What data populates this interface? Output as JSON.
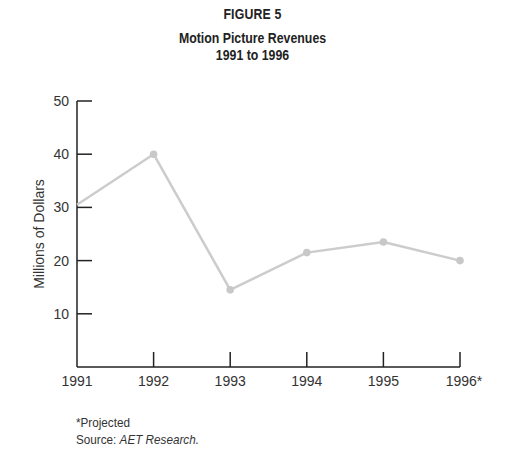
{
  "figure_label": "FIGURE 5",
  "title_line1": "Motion Picture Revenues",
  "title_line2": "1991 to 1996",
  "footer": {
    "note": "*Projected",
    "source_prefix": "Source: ",
    "source_name": "AET Research."
  },
  "colors": {
    "axis": "#222222",
    "line": "#cccccc",
    "marker": "#c8c8c8"
  },
  "chart_data": {
    "type": "line",
    "title": "Motion Picture Revenues 1991 to 1996",
    "xlabel": "",
    "ylabel": "Millions of Dollars",
    "categories": [
      "1991",
      "1992",
      "1993",
      "1994",
      "1995",
      "1996*"
    ],
    "series": [
      {
        "name": "Motion Picture Revenues",
        "values": [
          30.5,
          40,
          14.5,
          21.5,
          23.5,
          20
        ]
      }
    ],
    "ylim": [
      0,
      50
    ],
    "yticks": [
      10,
      20,
      30,
      40,
      50
    ],
    "grid": false,
    "legend": "none",
    "annotations": [
      "*Projected",
      "Source: AET Research."
    ]
  }
}
